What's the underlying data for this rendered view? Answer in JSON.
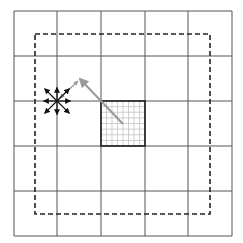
{
  "diagram": {
    "grid": {
      "rows": 5,
      "cols": 5,
      "x_lines": [
        14,
        57,
        101,
        145,
        188,
        232
      ],
      "y_lines": [
        11,
        56,
        101,
        146,
        191,
        236
      ],
      "line_color": "#555555"
    },
    "dashed_boundary": {
      "x": 35,
      "y": 34,
      "width": 175,
      "height": 180,
      "color": "#222222"
    },
    "highlighted_cell": {
      "x": 101,
      "y": 101,
      "width": 44,
      "height": 45,
      "subdivisions": 8,
      "border_color": "#222222",
      "mesh_color": "#bbbbbb"
    },
    "gray_arrow": {
      "from": [
        123,
        124
      ],
      "to": [
        80,
        79
      ],
      "color": "#999999"
    },
    "small_gray_arrow": {
      "from": [
        80,
        79
      ],
      "to": [
        60,
        98
      ],
      "color": "#999999"
    },
    "star_node": {
      "cx": 57,
      "cy": 101,
      "arrow_length": 16,
      "directions": 8,
      "color": "#111111"
    }
  }
}
